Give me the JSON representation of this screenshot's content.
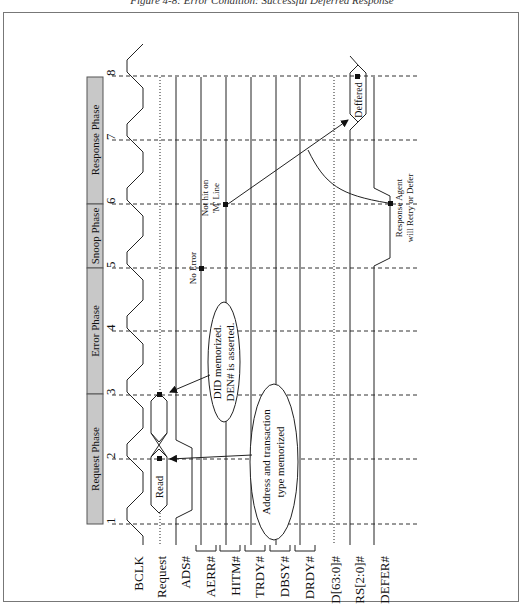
{
  "caption": "Figure 4-8: Error Condition: Successful Deferred Response",
  "phases": [
    {
      "label": "Request Phase",
      "from_clock": 1,
      "to_clock": 3
    },
    {
      "label": "Error Phase",
      "from_clock": 3,
      "to_clock": 5
    },
    {
      "label": "Snoop Phase",
      "from_clock": 5,
      "to_clock": 6
    },
    {
      "label": "Response Phase",
      "from_clock": 6,
      "to_clock": 8
    }
  ],
  "clocks": [
    "1",
    "2",
    "3",
    "4",
    "5",
    "6",
    "7",
    "8"
  ],
  "signals": [
    {
      "name": "BCLK"
    },
    {
      "name": "Request"
    },
    {
      "name": "ADS#"
    },
    {
      "name": "AERR#"
    },
    {
      "name": "HITM#"
    },
    {
      "name": "TRDY#"
    },
    {
      "name": "DBSY#"
    },
    {
      "name": "DRDY#"
    },
    {
      "name": "D[63:0]#"
    },
    {
      "name": "RS[2:0]#"
    },
    {
      "name": "DEFER#"
    }
  ],
  "bus_values": {
    "request_1": "Read",
    "rs_response": "Deffered"
  },
  "annotations": {
    "address_memorized_line1": "Address and transaction",
    "address_memorized_line2": "type memorized",
    "did_memorized_line1": "DID memorized.",
    "did_memorized_line2": "DEN# is asserted.",
    "no_error": "No Error",
    "not_hit_line1": "Not hit on",
    "not_hit_line2": "'M' Line",
    "response_agent_line1": "Response Agent",
    "response_agent_line2": "will Retry or Defer"
  },
  "colors": {
    "phase_fill": "#c8c8c8",
    "line": "#222222",
    "frame": "#777777"
  }
}
